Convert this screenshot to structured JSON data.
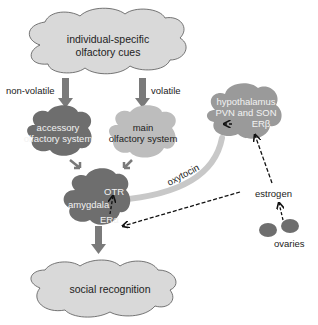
{
  "nodes": {
    "cues": {
      "line1": "individual-specific",
      "line2": "olfactory cues"
    },
    "accessory": {
      "line1": "accessory",
      "line2": "olfactory system"
    },
    "main": {
      "line1": "main",
      "line2": "olfactory system"
    },
    "hypothalamus": {
      "line1": "hypothalamus",
      "line2": "PVN and SON",
      "line3": "ERβ"
    },
    "amygdala": {
      "label": "amygdala",
      "otr": "OTR",
      "era": "ERα"
    },
    "ovaries": {
      "label": "ovaries"
    },
    "social": {
      "label": "social recognition"
    }
  },
  "edges": {
    "non_volatile": "non-volatile",
    "volatile": "volatile",
    "oxytocin": "oxytocin",
    "estrogen": "estrogen"
  },
  "colors": {
    "light_cloud": "#d9d9d9",
    "dark_cloud": "#6e6e6e",
    "mid_cloud": "#bdbdbd",
    "hypo_cloud": "#9a9a9a",
    "arrow": "#7a7a7a"
  }
}
